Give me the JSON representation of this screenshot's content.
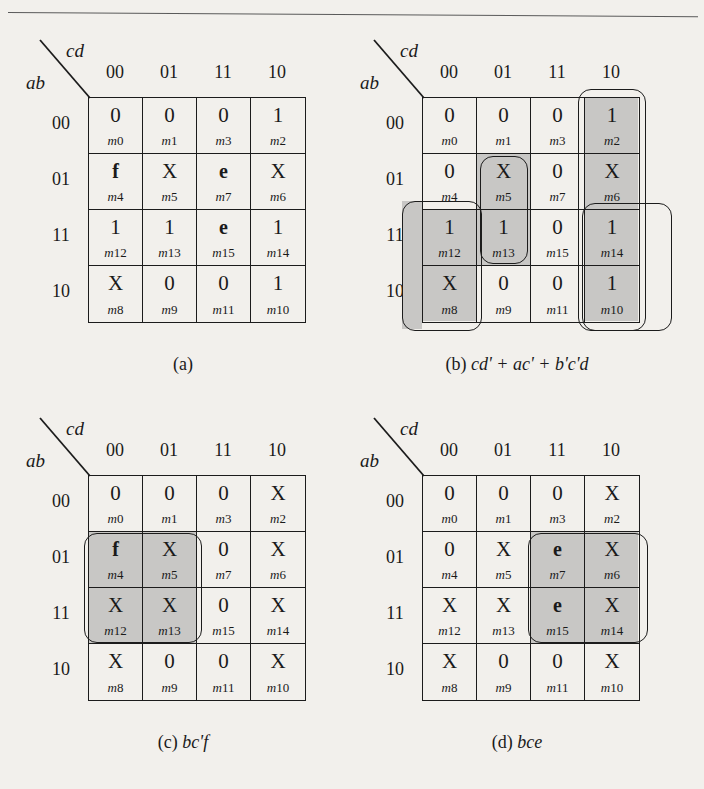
{
  "figure": {
    "col_labels": [
      "00",
      "01",
      "11",
      "10"
    ],
    "row_labels": [
      "00",
      "01",
      "11",
      "10"
    ],
    "axis_top": "cd",
    "axis_left": "ab",
    "shade_color": "#c8c7c5",
    "line_color": "#1c1c1c"
  },
  "maps": [
    {
      "id": "a",
      "caption_label": "(a)",
      "caption_expr": "",
      "cells": [
        {
          "value": "0",
          "bold": false,
          "minterm": "m0",
          "shaded": false
        },
        {
          "value": "0",
          "bold": false,
          "minterm": "m1",
          "shaded": false
        },
        {
          "value": "0",
          "bold": false,
          "minterm": "m3",
          "shaded": false
        },
        {
          "value": "1",
          "bold": false,
          "minterm": "m2",
          "shaded": false
        },
        {
          "value": "f",
          "bold": true,
          "minterm": "m4",
          "shaded": false
        },
        {
          "value": "X",
          "bold": false,
          "minterm": "m5",
          "shaded": false
        },
        {
          "value": "e",
          "bold": true,
          "minterm": "m7",
          "shaded": false
        },
        {
          "value": "X",
          "bold": false,
          "minterm": "m6",
          "shaded": false
        },
        {
          "value": "1",
          "bold": false,
          "minterm": "m12",
          "shaded": false
        },
        {
          "value": "1",
          "bold": false,
          "minterm": "m13",
          "shaded": false
        },
        {
          "value": "e",
          "bold": true,
          "minterm": "m15",
          "shaded": false
        },
        {
          "value": "1",
          "bold": false,
          "minterm": "m14",
          "shaded": false
        },
        {
          "value": "X",
          "bold": false,
          "minterm": "m8",
          "shaded": false
        },
        {
          "value": "0",
          "bold": false,
          "minterm": "m9",
          "shaded": false
        },
        {
          "value": "0",
          "bold": false,
          "minterm": "m11",
          "shaded": false
        },
        {
          "value": "1",
          "bold": false,
          "minterm": "m10",
          "shaded": false
        }
      ],
      "groups": []
    },
    {
      "id": "b",
      "caption_label": "(b)",
      "caption_expr": "cd' + ac' + b'c'd",
      "cells": [
        {
          "value": "0",
          "bold": false,
          "minterm": "m0",
          "shaded": false
        },
        {
          "value": "0",
          "bold": false,
          "minterm": "m1",
          "shaded": false
        },
        {
          "value": "0",
          "bold": false,
          "minterm": "m3",
          "shaded": false
        },
        {
          "value": "1",
          "bold": false,
          "minterm": "m2",
          "shaded": true
        },
        {
          "value": "0",
          "bold": false,
          "minterm": "m4",
          "shaded": false
        },
        {
          "value": "X",
          "bold": false,
          "minterm": "m5",
          "shaded": true
        },
        {
          "value": "0",
          "bold": false,
          "minterm": "m7",
          "shaded": false
        },
        {
          "value": "X",
          "bold": false,
          "minterm": "m6",
          "shaded": true
        },
        {
          "value": "1",
          "bold": false,
          "minterm": "m12",
          "shaded": true
        },
        {
          "value": "1",
          "bold": false,
          "minterm": "m13",
          "shaded": true
        },
        {
          "value": "0",
          "bold": false,
          "minterm": "m15",
          "shaded": false
        },
        {
          "value": "1",
          "bold": false,
          "minterm": "m14",
          "shaded": true
        },
        {
          "value": "X",
          "bold": false,
          "minterm": "m8",
          "shaded": true
        },
        {
          "value": "0",
          "bold": false,
          "minterm": "m9",
          "shaded": false
        },
        {
          "value": "0",
          "bold": false,
          "minterm": "m11",
          "shaded": false
        },
        {
          "value": "1",
          "bold": false,
          "minterm": "m10",
          "shaded": true
        }
      ],
      "groups": [
        "cd-prime-column",
        "ac-prime-pair",
        "b-prime-c-prime-d-pair",
        "wrap-left-pair"
      ]
    },
    {
      "id": "c",
      "caption_label": "(c)",
      "caption_expr": "bc'f",
      "cells": [
        {
          "value": "0",
          "bold": false,
          "minterm": "m0",
          "shaded": false
        },
        {
          "value": "0",
          "bold": false,
          "minterm": "m1",
          "shaded": false
        },
        {
          "value": "0",
          "bold": false,
          "minterm": "m3",
          "shaded": false
        },
        {
          "value": "X",
          "bold": false,
          "minterm": "m2",
          "shaded": false
        },
        {
          "value": "f",
          "bold": true,
          "minterm": "m4",
          "shaded": true
        },
        {
          "value": "X",
          "bold": false,
          "minterm": "m5",
          "shaded": true
        },
        {
          "value": "0",
          "bold": false,
          "minterm": "m7",
          "shaded": false
        },
        {
          "value": "X",
          "bold": false,
          "minterm": "m6",
          "shaded": false
        },
        {
          "value": "X",
          "bold": false,
          "minterm": "m12",
          "shaded": true
        },
        {
          "value": "X",
          "bold": false,
          "minterm": "m13",
          "shaded": true
        },
        {
          "value": "0",
          "bold": false,
          "minterm": "m15",
          "shaded": false
        },
        {
          "value": "X",
          "bold": false,
          "minterm": "m14",
          "shaded": false
        },
        {
          "value": "X",
          "bold": false,
          "minterm": "m8",
          "shaded": false
        },
        {
          "value": "0",
          "bold": false,
          "minterm": "m9",
          "shaded": false
        },
        {
          "value": "0",
          "bold": false,
          "minterm": "m11",
          "shaded": false
        },
        {
          "value": "X",
          "bold": false,
          "minterm": "m10",
          "shaded": false
        }
      ],
      "groups": [
        "bc-prime-f-quad"
      ]
    },
    {
      "id": "d",
      "caption_label": "(d)",
      "caption_expr": "bce",
      "cells": [
        {
          "value": "0",
          "bold": false,
          "minterm": "m0",
          "shaded": false
        },
        {
          "value": "0",
          "bold": false,
          "minterm": "m1",
          "shaded": false
        },
        {
          "value": "0",
          "bold": false,
          "minterm": "m3",
          "shaded": false
        },
        {
          "value": "X",
          "bold": false,
          "minterm": "m2",
          "shaded": false
        },
        {
          "value": "0",
          "bold": false,
          "minterm": "m4",
          "shaded": false
        },
        {
          "value": "X",
          "bold": false,
          "minterm": "m5",
          "shaded": false
        },
        {
          "value": "e",
          "bold": true,
          "minterm": "m7",
          "shaded": true
        },
        {
          "value": "X",
          "bold": false,
          "minterm": "m6",
          "shaded": true
        },
        {
          "value": "X",
          "bold": false,
          "minterm": "m12",
          "shaded": false
        },
        {
          "value": "X",
          "bold": false,
          "minterm": "m13",
          "shaded": false
        },
        {
          "value": "e",
          "bold": true,
          "minterm": "m15",
          "shaded": true
        },
        {
          "value": "X",
          "bold": false,
          "minterm": "m14",
          "shaded": true
        },
        {
          "value": "X",
          "bold": false,
          "minterm": "m8",
          "shaded": false
        },
        {
          "value": "0",
          "bold": false,
          "minterm": "m9",
          "shaded": false
        },
        {
          "value": "0",
          "bold": false,
          "minterm": "m11",
          "shaded": false
        },
        {
          "value": "X",
          "bold": false,
          "minterm": "m10",
          "shaded": false
        }
      ],
      "groups": [
        "bce-quad"
      ]
    }
  ]
}
